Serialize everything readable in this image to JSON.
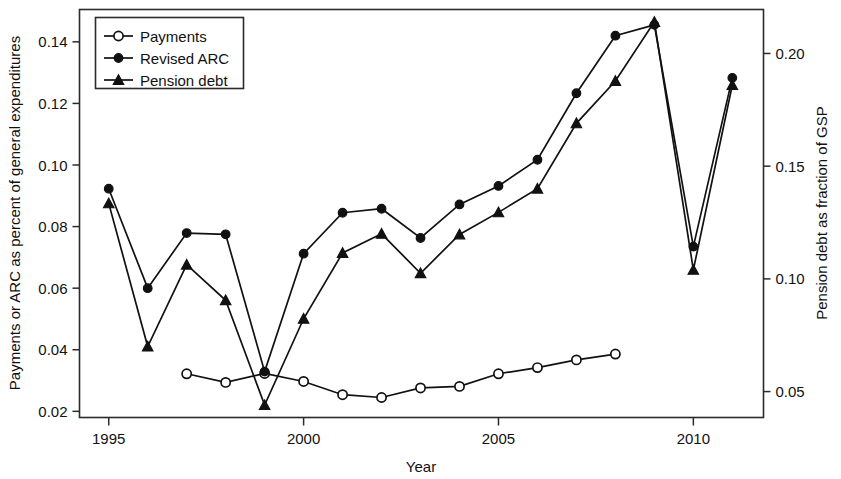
{
  "chart_data": {
    "type": "line",
    "title": "",
    "xlabel": "Year",
    "ylabel": "Payments or ARC as percent of general expenditures",
    "y2label": "Pension debt as fraction of GSP",
    "x": [
      1995,
      1996,
      1997,
      1998,
      1999,
      2000,
      2001,
      2002,
      2003,
      2004,
      2005,
      2006,
      2007,
      2008,
      2009,
      2010,
      2011
    ],
    "xlim": [
      1994.25,
      2011.8
    ],
    "ylim": [
      0.018,
      0.1505
    ],
    "y2lim": [
      0.0385,
      0.2195
    ],
    "xticks": [
      1995,
      2000,
      2005,
      2010
    ],
    "xtick_labels": [
      "1995",
      "2000",
      "2005",
      "2010"
    ],
    "yticks": [
      0.02,
      0.04,
      0.06,
      0.08,
      0.1,
      0.12,
      0.14
    ],
    "ytick_labels": [
      "0.02",
      "0.04",
      "0.06",
      "0.08",
      "0.10",
      "0.12",
      "0.14"
    ],
    "y2ticks": [
      0.05,
      0.1,
      0.15,
      0.2
    ],
    "y2tick_labels": [
      "0.05",
      "0.10",
      "0.15",
      "0.20"
    ],
    "grid": false,
    "legend_position": "top-left",
    "series": [
      {
        "name": "Payments",
        "marker": "open-circle",
        "axis": "left",
        "x": [
          1997,
          1998,
          1999,
          2000,
          2001,
          2002,
          2003,
          2004,
          2005,
          2006,
          2007,
          2008
        ],
        "values": [
          0.0322,
          0.0294,
          0.0323,
          0.0297,
          0.0254,
          0.0245,
          0.0276,
          0.0281,
          0.0322,
          0.0342,
          0.0367,
          0.0386
        ]
      },
      {
        "name": "Revised ARC",
        "marker": "filled-circle",
        "axis": "left",
        "x": [
          1995,
          1996,
          1997,
          1998,
          1999,
          2000,
          2001,
          2002,
          2003,
          2004,
          2005,
          2006,
          2007,
          2008,
          2009,
          2010,
          2011
        ],
        "values": [
          0.0923,
          0.06,
          0.0779,
          0.0775,
          0.0329,
          0.0712,
          0.0845,
          0.0858,
          0.0763,
          0.0872,
          0.0932,
          0.1017,
          0.1233,
          0.142,
          0.1455,
          0.0735,
          0.1283
        ]
      },
      {
        "name": "Pension debt",
        "marker": "filled-triangle",
        "axis": "right",
        "x": [
          1995,
          1996,
          1997,
          1998,
          1999,
          2000,
          2001,
          2002,
          2003,
          2004,
          2005,
          2006,
          2007,
          2008,
          2009,
          2010,
          2011
        ],
        "values": [
          0.1335,
          0.07,
          0.1063,
          0.0905,
          0.044,
          0.0823,
          0.1115,
          0.12,
          0.1025,
          0.1197,
          0.1295,
          0.14,
          0.169,
          0.1878,
          0.214,
          0.104,
          0.186
        ],
        "values_left_equivalent": [
          0.0876,
          0.0428,
          0.068,
          0.0582,
          0.0242,
          0.0506,
          0.0748,
          0.0808,
          0.066,
          0.0806,
          0.085,
          0.0958,
          0.1152,
          0.1287,
          0.1455,
          0.0652,
          0.1262
        ]
      }
    ],
    "colors": {
      "line": "#111111",
      "frame": "#2b2b2b",
      "background": "#ffffff"
    }
  }
}
